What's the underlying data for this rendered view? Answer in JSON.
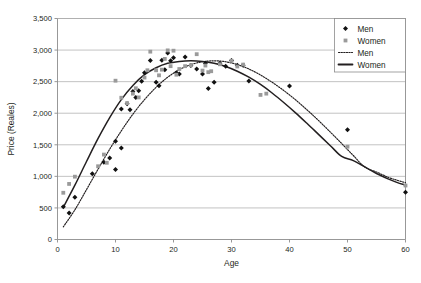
{
  "chart_data": {
    "type": "scatter",
    "title": "",
    "xlabel": "Age",
    "ylabel": "Price (Reales)",
    "xlim": [
      0,
      60
    ],
    "ylim": [
      0,
      3500
    ],
    "xticks": [
      0,
      10,
      20,
      30,
      40,
      50,
      60
    ],
    "xticklabels": [
      "0",
      "10",
      "20",
      "30",
      "40",
      "50",
      "60"
    ],
    "yticks": [
      0,
      500,
      1000,
      1500,
      2000,
      2500,
      3000,
      3500
    ],
    "yticklabels": [
      "0",
      "500",
      "1,000",
      "1,500",
      "2,000",
      "2,500",
      "3,000",
      "3,500"
    ],
    "grid": "horizontal",
    "legend_position": "top-right",
    "legend": [
      {
        "label": "Men",
        "type": "marker",
        "marker": "diamond",
        "color": "#111111"
      },
      {
        "label": "Women",
        "type": "marker",
        "marker": "square",
        "color": "#9a9a9a"
      },
      {
        "label": "Men",
        "type": "line",
        "style": "dotted",
        "color": "#231f20"
      },
      {
        "label": "Women",
        "type": "line",
        "style": "solid",
        "color": "#231f20"
      }
    ],
    "series": [
      {
        "name": "Men",
        "type": "scatter",
        "marker": "diamond",
        "color": "#111111",
        "points": [
          [
            1,
            520
          ],
          [
            2,
            420
          ],
          [
            3,
            670
          ],
          [
            6,
            1040
          ],
          [
            8,
            1225
          ],
          [
            9,
            1290
          ],
          [
            10,
            1555
          ],
          [
            10,
            1110
          ],
          [
            11,
            1450
          ],
          [
            11,
            2065
          ],
          [
            12,
            2150
          ],
          [
            12.5,
            2055
          ],
          [
            13,
            2345
          ],
          [
            13.5,
            2250
          ],
          [
            14,
            2355
          ],
          [
            14.5,
            2505
          ],
          [
            15,
            2640
          ],
          [
            16,
            2835
          ],
          [
            17,
            2490
          ],
          [
            17.5,
            2435
          ],
          [
            18,
            2840
          ],
          [
            18.5,
            2690
          ],
          [
            19,
            2955
          ],
          [
            19.5,
            2830
          ],
          [
            20,
            2880
          ],
          [
            20.5,
            2640
          ],
          [
            21,
            2620
          ],
          [
            22,
            2890
          ],
          [
            23,
            2755
          ],
          [
            24,
            2700
          ],
          [
            25,
            2620
          ],
          [
            25.5,
            2790
          ],
          [
            26,
            2390
          ],
          [
            27,
            2490
          ],
          [
            28,
            2790
          ],
          [
            29,
            2745
          ],
          [
            30,
            2835
          ],
          [
            31,
            2760
          ],
          [
            32,
            2760
          ],
          [
            33,
            2510
          ],
          [
            40,
            2430
          ],
          [
            50,
            1740
          ],
          [
            60,
            750
          ]
        ]
      },
      {
        "name": "Women",
        "type": "scatter",
        "marker": "square",
        "color": "#9a9a9a",
        "points": [
          [
            1,
            740
          ],
          [
            2,
            880
          ],
          [
            3,
            995
          ],
          [
            7,
            1160
          ],
          [
            8,
            1345
          ],
          [
            8.5,
            1215
          ],
          [
            10,
            2515
          ],
          [
            11,
            2245
          ],
          [
            12,
            2160
          ],
          [
            13,
            2310
          ],
          [
            13.5,
            2395
          ],
          [
            14,
            2250
          ],
          [
            15,
            2565
          ],
          [
            15.5,
            2680
          ],
          [
            16,
            2975
          ],
          [
            17,
            2680
          ],
          [
            17.5,
            2600
          ],
          [
            18,
            2690
          ],
          [
            18.5,
            2860
          ],
          [
            19,
            2995
          ],
          [
            19.5,
            2745
          ],
          [
            20,
            2990
          ],
          [
            20.5,
            2610
          ],
          [
            21,
            2700
          ],
          [
            22,
            2745
          ],
          [
            23,
            2760
          ],
          [
            24,
            2935
          ],
          [
            25,
            2675
          ],
          [
            25.5,
            2755
          ],
          [
            26,
            2650
          ],
          [
            26.5,
            2665
          ],
          [
            28,
            2775
          ],
          [
            30,
            2830
          ],
          [
            31,
            2740
          ],
          [
            32,
            2770
          ],
          [
            35,
            2290
          ],
          [
            36,
            2310
          ],
          [
            50,
            1470
          ],
          [
            60,
            855
          ]
        ]
      },
      {
        "name": "Men",
        "type": "line",
        "style": "dotted",
        "color": "#231f20",
        "fit": [
          [
            1,
            200
          ],
          [
            3,
            470
          ],
          [
            5,
            790
          ],
          [
            7,
            1115
          ],
          [
            9,
            1430
          ],
          [
            11,
            1720
          ],
          [
            13,
            1985
          ],
          [
            15,
            2215
          ],
          [
            17,
            2410
          ],
          [
            19,
            2570
          ],
          [
            21,
            2690
          ],
          [
            23,
            2770
          ],
          [
            25,
            2815
          ],
          [
            27,
            2830
          ],
          [
            29,
            2815
          ],
          [
            31,
            2770
          ],
          [
            33,
            2700
          ],
          [
            35,
            2605
          ],
          [
            37,
            2490
          ],
          [
            39,
            2360
          ],
          [
            41,
            2215
          ],
          [
            43,
            2055
          ],
          [
            45,
            1885
          ],
          [
            47,
            1705
          ],
          [
            49,
            1520
          ],
          [
            51,
            1330
          ],
          [
            53,
            1145
          ],
          [
            55,
            1070
          ],
          [
            57,
            985
          ],
          [
            58.5,
            940
          ],
          [
            60,
            900
          ]
        ]
      },
      {
        "name": "Women",
        "type": "line",
        "style": "solid",
        "color": "#231f20",
        "fit": [
          [
            1,
            510
          ],
          [
            3,
            860
          ],
          [
            5,
            1235
          ],
          [
            7,
            1600
          ],
          [
            9,
            1930
          ],
          [
            11,
            2215
          ],
          [
            13,
            2440
          ],
          [
            15,
            2610
          ],
          [
            17,
            2720
          ],
          [
            19,
            2790
          ],
          [
            21,
            2820
          ],
          [
            23,
            2830
          ],
          [
            25,
            2820
          ],
          [
            27,
            2790
          ],
          [
            29,
            2740
          ],
          [
            31,
            2665
          ],
          [
            33,
            2570
          ],
          [
            35,
            2455
          ],
          [
            37,
            2320
          ],
          [
            39,
            2170
          ],
          [
            41,
            2010
          ],
          [
            43,
            1840
          ],
          [
            45,
            1665
          ],
          [
            47,
            1490
          ],
          [
            49,
            1315
          ],
          [
            51,
            1250
          ],
          [
            53,
            1150
          ],
          [
            55,
            1045
          ],
          [
            57,
            960
          ],
          [
            58.5,
            905
          ],
          [
            60,
            860
          ]
        ]
      }
    ]
  }
}
